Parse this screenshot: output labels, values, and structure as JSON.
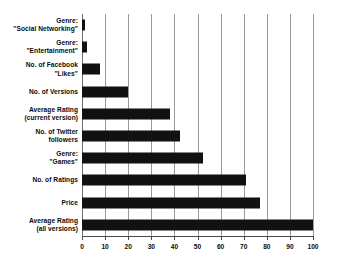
{
  "chart_data": {
    "type": "bar",
    "orientation": "horizontal",
    "title": "",
    "subtitle": "",
    "xlabel": "",
    "ylabel": "",
    "xlim": [
      0,
      100
    ],
    "xticks": [
      0,
      10,
      20,
      30,
      40,
      50,
      60,
      70,
      80,
      90,
      100
    ],
    "xtick_labels": [
      "0",
      "10",
      "20",
      "30",
      "40",
      "50",
      "60",
      "70",
      "80",
      "90",
      "100"
    ],
    "grid": "vertical",
    "legend": "none",
    "bar_color": "#111111",
    "gridline_color": "#9a9a9a",
    "axis_color": "#4a4a4a",
    "categories": [
      "Genre: \"Social Networking\"",
      "Genre: \"Entertainment\"",
      "No. of Facebook \"Likes\"",
      "No. of Versions",
      "Average Rating (current version)",
      "No. of Twitter followers",
      "Genre: \"Games\"",
      "No. of Ratings",
      "Price",
      "Average Rating (all versions)"
    ],
    "category_lines": [
      [
        "Genre:",
        "\"Social Networking\""
      ],
      [
        "Genre:",
        "\"Entertainment\""
      ],
      [
        "No. of Facebook",
        "\"Likes\""
      ],
      [
        "No. of Versions"
      ],
      [
        "Average Rating",
        "(current version)"
      ],
      [
        "No. of Twitter",
        "followers"
      ],
      [
        "Genre:",
        "\"Games\""
      ],
      [
        "No. of Ratings"
      ],
      [
        "Price"
      ],
      [
        "Average Rating",
        "(all versions)"
      ]
    ],
    "values": [
      1.5,
      2,
      8,
      20,
      38,
      42.5,
      52.5,
      71,
      77,
      100
    ]
  }
}
